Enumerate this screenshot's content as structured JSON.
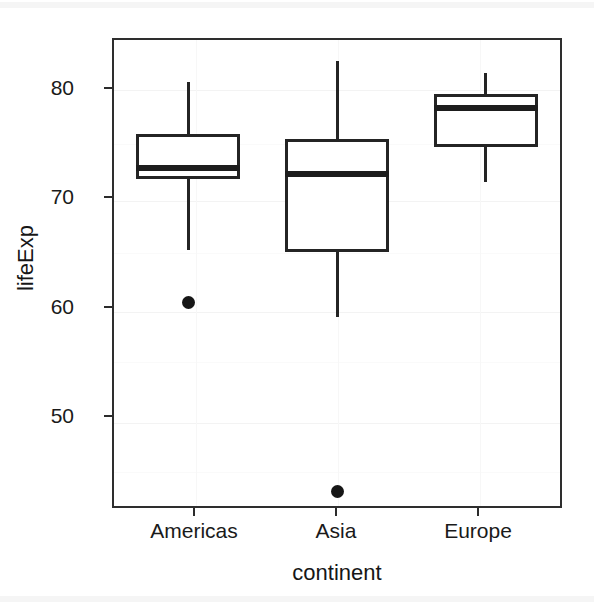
{
  "chart_data": {
    "type": "boxplot",
    "title": "",
    "xlabel": "continent",
    "ylabel": "lifeExp",
    "categories": [
      "Americas",
      "Asia",
      "Europe"
    ],
    "y_ticks": [
      50,
      60,
      70,
      80
    ],
    "ylim": [
      42.5,
      84.5
    ],
    "grid": true,
    "legend": "none",
    "series": [
      {
        "name": "Americas",
        "min_whisker": 65.6,
        "q1": 72.0,
        "median": 73.0,
        "q3": 76.0,
        "max_whisker": 80.7,
        "outliers": [
          60.8
        ]
      },
      {
        "name": "Asia",
        "min_whisker": 59.5,
        "q1": 65.4,
        "median": 72.4,
        "q3": 75.6,
        "max_whisker": 82.6,
        "outliers": [
          43.8
        ]
      },
      {
        "name": "Europe",
        "min_whisker": 71.7,
        "q1": 74.9,
        "median": 78.4,
        "q3": 79.6,
        "max_whisker": 81.5,
        "outliers": []
      }
    ]
  },
  "axes": {
    "y_title": "lifeExp",
    "x_title": "continent",
    "y_tick_labels": [
      "80",
      "70",
      "60",
      "50"
    ],
    "x_tick_labels": [
      "Americas",
      "Asia",
      "Europe"
    ]
  },
  "colors": {
    "box_stroke": "#242424",
    "median": "#1d1d1d",
    "outlier": "#161616",
    "panel_border": "#2e2e2e",
    "grid": "#f3f3f3",
    "background": "#ffffff",
    "text": "#1a1a1a"
  }
}
